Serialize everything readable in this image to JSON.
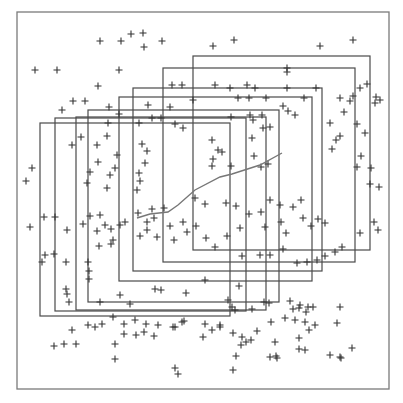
{
  "chart_data": {
    "type": "scatter",
    "title": "",
    "xlabel": "",
    "ylabel": "",
    "grid": false,
    "frame": {
      "x": 17,
      "y": 12,
      "w": 372,
      "h": 377,
      "color": "#7a7a7a"
    },
    "marker": "+",
    "marker_color": "#333333",
    "rect_color": "#4a4a4a",
    "line_color": "#777777",
    "rectangles": [
      {
        "x": 40,
        "y": 123,
        "w": 190,
        "h": 193
      },
      {
        "x": 55,
        "y": 118,
        "w": 191,
        "h": 193
      },
      {
        "x": 76,
        "y": 117,
        "w": 190,
        "h": 193
      },
      {
        "x": 88,
        "y": 110,
        "w": 191,
        "h": 192
      },
      {
        "x": 119,
        "y": 97,
        "w": 193,
        "h": 184
      },
      {
        "x": 133,
        "y": 88,
        "w": 189,
        "h": 183
      },
      {
        "x": 163,
        "y": 68,
        "w": 192,
        "h": 194
      },
      {
        "x": 193,
        "y": 56,
        "w": 177,
        "h": 194
      }
    ],
    "trend_line": [
      [
        137,
        218
      ],
      [
        150,
        214
      ],
      [
        168,
        212
      ],
      [
        178,
        205
      ],
      [
        195,
        190
      ],
      [
        220,
        177
      ],
      [
        232,
        174
      ],
      [
        260,
        165
      ],
      [
        282,
        153
      ]
    ],
    "points": [
      [
        100,
        41
      ],
      [
        121,
        41
      ],
      [
        131,
        34
      ],
      [
        143,
        33
      ],
      [
        162,
        41
      ],
      [
        144,
        47
      ],
      [
        213,
        46
      ],
      [
        234,
        40
      ],
      [
        320,
        46
      ],
      [
        353,
        40
      ],
      [
        35,
        70
      ],
      [
        57,
        70
      ],
      [
        119,
        70
      ],
      [
        98,
        86
      ],
      [
        73,
        101
      ],
      [
        85,
        101
      ],
      [
        62,
        110
      ],
      [
        109,
        107
      ],
      [
        148,
        105
      ],
      [
        119,
        114
      ],
      [
        182,
        85
      ],
      [
        172,
        85
      ],
      [
        152,
        118
      ],
      [
        170,
        107
      ],
      [
        193,
        100
      ],
      [
        215,
        85
      ],
      [
        230,
        88
      ],
      [
        255,
        88
      ],
      [
        247,
        85
      ],
      [
        287,
        68
      ],
      [
        287,
        72
      ],
      [
        238,
        98
      ],
      [
        249,
        98
      ],
      [
        266,
        98
      ],
      [
        287,
        88
      ],
      [
        316,
        88
      ],
      [
        340,
        98
      ],
      [
        367,
        84
      ],
      [
        360,
        88
      ],
      [
        376,
        97
      ],
      [
        350,
        101
      ],
      [
        375,
        103
      ],
      [
        108,
        123
      ],
      [
        139,
        123
      ],
      [
        161,
        118
      ],
      [
        175,
        124
      ],
      [
        183,
        128
      ],
      [
        81,
        137
      ],
      [
        72,
        145
      ],
      [
        97,
        145
      ],
      [
        107,
        136
      ],
      [
        117,
        155
      ],
      [
        98,
        162
      ],
      [
        142,
        144
      ],
      [
        147,
        151
      ],
      [
        145,
        163
      ],
      [
        139,
        173
      ],
      [
        140,
        181
      ],
      [
        137,
        190
      ],
      [
        115,
        168
      ],
      [
        110,
        175
      ],
      [
        90,
        172
      ],
      [
        87,
        183
      ],
      [
        107,
        188
      ],
      [
        231,
        117
      ],
      [
        250,
        115
      ],
      [
        262,
        115
      ],
      [
        253,
        120
      ],
      [
        270,
        127
      ],
      [
        295,
        115
      ],
      [
        283,
        106
      ],
      [
        288,
        111
      ],
      [
        304,
        98
      ],
      [
        344,
        112
      ],
      [
        353,
        96
      ],
      [
        380,
        100
      ],
      [
        212,
        140
      ],
      [
        218,
        150
      ],
      [
        212,
        166
      ],
      [
        252,
        138
      ],
      [
        213,
        159
      ],
      [
        263,
        128
      ],
      [
        222,
        152
      ],
      [
        254,
        156
      ],
      [
        231,
        166
      ],
      [
        261,
        167
      ],
      [
        268,
        164
      ],
      [
        330,
        123
      ],
      [
        357,
        124
      ],
      [
        365,
        133
      ],
      [
        332,
        149
      ],
      [
        336,
        140
      ],
      [
        340,
        136
      ],
      [
        361,
        156
      ],
      [
        357,
        167
      ],
      [
        370,
        184
      ],
      [
        379,
        187
      ],
      [
        371,
        168
      ],
      [
        32,
        168
      ],
      [
        26,
        181
      ],
      [
        30,
        227
      ],
      [
        44,
        217
      ],
      [
        55,
        217
      ],
      [
        67,
        230
      ],
      [
        45,
        255
      ],
      [
        42,
        262
      ],
      [
        66,
        262
      ],
      [
        54,
        254
      ],
      [
        66,
        289
      ],
      [
        90,
        216
      ],
      [
        100,
        215
      ],
      [
        105,
        225
      ],
      [
        97,
        231
      ],
      [
        83,
        224
      ],
      [
        120,
        225
      ],
      [
        125,
        222
      ],
      [
        113,
        240
      ],
      [
        111,
        229
      ],
      [
        99,
        246
      ],
      [
        111,
        244
      ],
      [
        138,
        213
      ],
      [
        152,
        209
      ],
      [
        164,
        208
      ],
      [
        154,
        218
      ],
      [
        147,
        222
      ],
      [
        147,
        230
      ],
      [
        140,
        236
      ],
      [
        157,
        237
      ],
      [
        170,
        226
      ],
      [
        183,
        222
      ],
      [
        174,
        240
      ],
      [
        195,
        198
      ],
      [
        205,
        204
      ],
      [
        226,
        203
      ],
      [
        236,
        206
      ],
      [
        249,
        214
      ],
      [
        261,
        212
      ],
      [
        270,
        200
      ],
      [
        280,
        205
      ],
      [
        293,
        207
      ],
      [
        301,
        200
      ],
      [
        303,
        218
      ],
      [
        325,
        223
      ],
      [
        187,
        232
      ],
      [
        196,
        226
      ],
      [
        206,
        238
      ],
      [
        215,
        247
      ],
      [
        227,
        236
      ],
      [
        240,
        228
      ],
      [
        265,
        227
      ],
      [
        281,
        222
      ],
      [
        286,
        233
      ],
      [
        311,
        226
      ],
      [
        318,
        219
      ],
      [
        242,
        256
      ],
      [
        260,
        255
      ],
      [
        270,
        255
      ],
      [
        283,
        249
      ],
      [
        297,
        263
      ],
      [
        307,
        262
      ],
      [
        317,
        260
      ],
      [
        325,
        256
      ],
      [
        335,
        252
      ],
      [
        342,
        247
      ],
      [
        360,
        233
      ],
      [
        374,
        222
      ],
      [
        378,
        230
      ],
      [
        88,
        262
      ],
      [
        89,
        271
      ],
      [
        89,
        279
      ],
      [
        67,
        294
      ],
      [
        69,
        302
      ],
      [
        100,
        302
      ],
      [
        120,
        295
      ],
      [
        130,
        304
      ],
      [
        161,
        290
      ],
      [
        155,
        289
      ],
      [
        186,
        293
      ],
      [
        205,
        280
      ],
      [
        239,
        286
      ],
      [
        228,
        300
      ],
      [
        232,
        307
      ],
      [
        235,
        310
      ],
      [
        252,
        309
      ],
      [
        264,
        302
      ],
      [
        269,
        303
      ],
      [
        290,
        301
      ],
      [
        293,
        309
      ],
      [
        300,
        305
      ],
      [
        308,
        307
      ],
      [
        313,
        307
      ],
      [
        340,
        307
      ],
      [
        95,
        327
      ],
      [
        88,
        325
      ],
      [
        102,
        324
      ],
      [
        113,
        317
      ],
      [
        124,
        324
      ],
      [
        135,
        320
      ],
      [
        146,
        324
      ],
      [
        158,
        325
      ],
      [
        173,
        327
      ],
      [
        182,
        322
      ],
      [
        205,
        324
      ],
      [
        220,
        327
      ],
      [
        72,
        330
      ],
      [
        54,
        346
      ],
      [
        64,
        344
      ],
      [
        76,
        344
      ],
      [
        115,
        344
      ],
      [
        124,
        334
      ],
      [
        136,
        335
      ],
      [
        144,
        332
      ],
      [
        154,
        336
      ],
      [
        175,
        327
      ],
      [
        184,
        321
      ],
      [
        203,
        337
      ],
      [
        212,
        330
      ],
      [
        220,
        325
      ],
      [
        233,
        333
      ],
      [
        242,
        337
      ],
      [
        246,
        342
      ],
      [
        257,
        331
      ],
      [
        271,
        322
      ],
      [
        285,
        318
      ],
      [
        295,
        320
      ],
      [
        299,
        308
      ],
      [
        306,
        312
      ],
      [
        236,
        356
      ],
      [
        276,
        356
      ],
      [
        305,
        322
      ],
      [
        315,
        325
      ],
      [
        337,
        323
      ],
      [
        299,
        338
      ],
      [
        299,
        349
      ],
      [
        305,
        350
      ],
      [
        309,
        330
      ],
      [
        330,
        355
      ],
      [
        341,
        358
      ],
      [
        352,
        348
      ],
      [
        175,
        368
      ],
      [
        178,
        374
      ],
      [
        241,
        345
      ],
      [
        251,
        340
      ],
      [
        275,
        342
      ],
      [
        277,
        358
      ],
      [
        115,
        359
      ],
      [
        233,
        370
      ],
      [
        270,
        357
      ],
      [
        340,
        357
      ]
    ]
  }
}
